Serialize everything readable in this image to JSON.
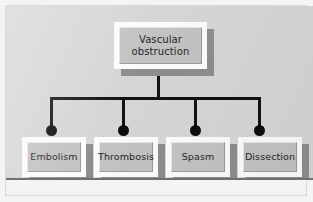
{
  "diagram": {
    "type": "tree",
    "orientation": "top-down",
    "root": {
      "id": "vascular-obstruction",
      "label": "Vascular obstruction",
      "label_line_1": "Vascular",
      "label_line_2": "obstruction"
    },
    "children": [
      {
        "id": "embolism",
        "label": "Embolism"
      },
      {
        "id": "thrombosis",
        "label": "Thrombosis"
      },
      {
        "id": "spasm",
        "label": "Spasm"
      },
      {
        "id": "dissection",
        "label": "Dissection"
      }
    ],
    "connector": {
      "style": "orthogonal-bus",
      "endpoint_marker": "filled-circle",
      "line_color": "#111111",
      "marker_color": "#0d0d0d"
    },
    "colors": {
      "canvas_background": "#d5d5d5",
      "page_background": "#f4f4f4",
      "frame_border": "#d8d8d8",
      "panel_bottom_edge": "#6f6f6f",
      "box_face": "#c2c2c2",
      "box_highlight": "#fbfbfb",
      "box_shadow": "#8d8d8d",
      "text": "#26262b"
    }
  }
}
